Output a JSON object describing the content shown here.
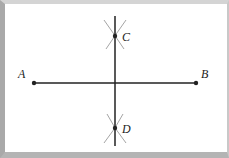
{
  "diagram": {
    "colors": {
      "line": "#222222",
      "arc": "#9a9a9a",
      "frame_left": "#a9a9a9",
      "frame_bottom": "#b4b4b4"
    },
    "points": {
      "A": {
        "label": "A",
        "x": 34,
        "y": 83,
        "lx": 18,
        "ly": 78
      },
      "B": {
        "label": "B",
        "x": 196,
        "y": 83,
        "lx": 201,
        "ly": 78
      },
      "C": {
        "label": "C",
        "x": 115,
        "y": 36,
        "lx": 122,
        "ly": 41
      },
      "D": {
        "label": "D",
        "x": 115,
        "y": 128,
        "lx": 122,
        "ly": 133
      }
    },
    "segment_AB": {
      "x1": 34,
      "y1": 83,
      "x2": 196,
      "y2": 83
    },
    "bisector_line": {
      "x1": 115,
      "y1": 16,
      "x2": 115,
      "y2": 146
    }
  }
}
